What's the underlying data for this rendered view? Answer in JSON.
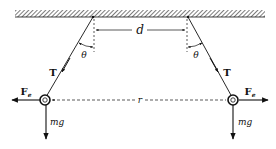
{
  "diagram": {
    "labels": {
      "separation_top": "d",
      "angle_left": "θ",
      "angle_right": "θ",
      "tension_left": "T",
      "tension_right": "T",
      "electric_force_left": "F",
      "electric_force_left_sub": "e",
      "electric_force_right": "F",
      "electric_force_right_sub": "e",
      "distance_between_spheres": "r",
      "weight_left": "mg",
      "weight_right": "mg"
    },
    "colors": {
      "ink": "#111111",
      "background": "#ffffff"
    }
  }
}
